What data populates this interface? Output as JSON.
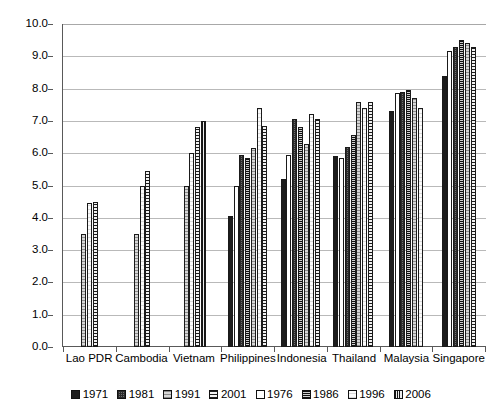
{
  "chart_data": {
    "type": "bar",
    "title": "",
    "xlabel": "",
    "ylabel": "",
    "ylim": [
      0.0,
      10.0
    ],
    "ytick_step": 1.0,
    "grid": true,
    "legend_position": "bottom",
    "ytick_labels": [
      "10.0",
      "9.0",
      "8.0",
      "7.0",
      "6.0",
      "5.0",
      "4.0",
      "3.0",
      "2.0",
      "1.0",
      "0.0"
    ],
    "categories": [
      "Lao PDR",
      "Cambodia",
      "Vietnam",
      "Philippines",
      "Indonesia",
      "Thailand",
      "Malaysia",
      "Singapore"
    ],
    "series": [
      {
        "name": "1971",
        "pattern": "solid-black",
        "values": [
          null,
          null,
          null,
          4.05,
          5.2,
          5.9,
          7.3,
          8.4
        ]
      },
      {
        "name": "1976",
        "pattern": "open-white",
        "values": [
          null,
          null,
          null,
          5.0,
          5.95,
          5.85,
          7.85,
          9.15
        ]
      },
      {
        "name": "1981",
        "pattern": "dark-checker",
        "values": [
          null,
          null,
          null,
          5.95,
          7.05,
          6.2,
          7.9,
          9.3
        ]
      },
      {
        "name": "1986",
        "pattern": "dense-checker",
        "values": [
          null,
          null,
          null,
          5.85,
          6.8,
          6.55,
          7.95,
          9.5
        ]
      },
      {
        "name": "1991",
        "pattern": "light-hatch",
        "values": [
          3.5,
          3.5,
          5.0,
          6.15,
          6.3,
          7.6,
          7.7,
          9.4
        ]
      },
      {
        "name": "1996",
        "pattern": "very-light-hatch",
        "values": [
          4.45,
          5.0,
          6.0,
          7.4,
          7.2,
          7.4,
          7.4,
          null
        ]
      },
      {
        "name": "2001",
        "pattern": "horizontal-stripe",
        "values": [
          4.5,
          5.45,
          6.8,
          6.85,
          7.05,
          7.6,
          null,
          9.3
        ]
      },
      {
        "name": "2006",
        "pattern": "vertical-stripe",
        "values": [
          null,
          null,
          7.0,
          null,
          null,
          null,
          null,
          null
        ]
      }
    ],
    "group_bars": [
      {
        "category": "Lao PDR",
        "bars": [
          {
            "series": "1991",
            "value": 3.5
          },
          {
            "series": "1996",
            "value": 4.45
          },
          {
            "series": "2001",
            "value": 4.5
          }
        ]
      },
      {
        "category": "Cambodia",
        "bars": [
          {
            "series": "1991",
            "value": 3.5
          },
          {
            "series": "1996",
            "value": 5.0
          },
          {
            "series": "2001",
            "value": 5.45
          }
        ]
      },
      {
        "category": "Vietnam",
        "bars": [
          {
            "series": "1991",
            "value": 5.0
          },
          {
            "series": "1996",
            "value": 6.0
          },
          {
            "series": "2001",
            "value": 6.8
          },
          {
            "series": "2006",
            "value": 7.0
          }
        ]
      },
      {
        "category": "Philippines",
        "bars": [
          {
            "series": "1971",
            "value": 4.05
          },
          {
            "series": "1976",
            "value": 5.0
          },
          {
            "series": "1981",
            "value": 5.95
          },
          {
            "series": "1986",
            "value": 5.85
          },
          {
            "series": "1991",
            "value": 6.15
          },
          {
            "series": "1996",
            "value": 7.4
          },
          {
            "series": "2001",
            "value": 6.85
          }
        ]
      },
      {
        "category": "Indonesia",
        "bars": [
          {
            "series": "1971",
            "value": 5.2
          },
          {
            "series": "1976",
            "value": 5.95
          },
          {
            "series": "1981",
            "value": 7.05
          },
          {
            "series": "1986",
            "value": 6.8
          },
          {
            "series": "1991",
            "value": 6.3
          },
          {
            "series": "1996",
            "value": 7.2
          },
          {
            "series": "2001",
            "value": 7.05
          }
        ]
      },
      {
        "category": "Thailand",
        "bars": [
          {
            "series": "1971",
            "value": 5.9
          },
          {
            "series": "1976",
            "value": 5.85
          },
          {
            "series": "1981",
            "value": 6.2
          },
          {
            "series": "1986",
            "value": 6.55
          },
          {
            "series": "1991",
            "value": 7.6
          },
          {
            "series": "1996",
            "value": 7.4
          },
          {
            "series": "2001",
            "value": 7.6
          }
        ]
      },
      {
        "category": "Malaysia",
        "bars": [
          {
            "series": "1971",
            "value": 7.3
          },
          {
            "series": "1976",
            "value": 7.85
          },
          {
            "series": "1981",
            "value": 7.9
          },
          {
            "series": "1986",
            "value": 7.95
          },
          {
            "series": "1991",
            "value": 7.7
          },
          {
            "series": "1996",
            "value": 7.4
          }
        ]
      },
      {
        "category": "Singapore",
        "bars": [
          {
            "series": "1971",
            "value": 8.4
          },
          {
            "series": "1976",
            "value": 9.15
          },
          {
            "series": "1981",
            "value": 9.3
          },
          {
            "series": "1986",
            "value": 9.5
          },
          {
            "series": "1991",
            "value": 9.4
          },
          {
            "series": "2001",
            "value": 9.3
          }
        ]
      }
    ],
    "legend": [
      {
        "label": "1971",
        "pattern": "solid-black"
      },
      {
        "label": "1981",
        "pattern": "dark-checker"
      },
      {
        "label": "1991",
        "pattern": "light-hatch"
      },
      {
        "label": "2001",
        "pattern": "horizontal-stripe"
      },
      {
        "label": "1976",
        "pattern": "open-white"
      },
      {
        "label": "1986",
        "pattern": "dense-checker"
      },
      {
        "label": "1996",
        "pattern": "very-light-hatch"
      },
      {
        "label": "2006",
        "pattern": "vertical-stripe"
      }
    ],
    "colors": {
      "axis": "#595959",
      "grid": "#b9b9b9",
      "text": "#000000",
      "background": "#ffffff"
    }
  }
}
